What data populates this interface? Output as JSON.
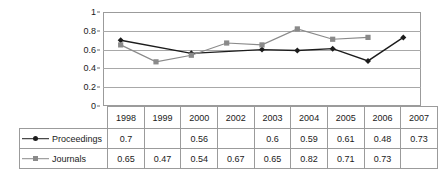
{
  "chart_data": {
    "type": "line",
    "title": "",
    "subtitle": "",
    "xlabel": "",
    "ylabel": "",
    "categories": [
      "1998",
      "1999",
      "2000",
      "2002",
      "2003",
      "2004",
      "2005",
      "2006",
      "2007"
    ],
    "series": [
      {
        "name": "Proceedings",
        "marker": "diamond",
        "color": "#1c1c1c",
        "values": [
          0.7,
          null,
          0.56,
          null,
          0.6,
          0.59,
          0.61,
          0.48,
          0.73
        ],
        "labels": [
          "0.7",
          "",
          "0.56",
          "",
          "0.6",
          "0.59",
          "0.61",
          "0.48",
          "0.73"
        ]
      },
      {
        "name": "Journals",
        "marker": "square",
        "color": "#8a8a8a",
        "values": [
          0.65,
          0.47,
          0.54,
          0.67,
          0.65,
          0.82,
          0.71,
          0.73,
          null
        ],
        "labels": [
          "0.65",
          "0.47",
          "0.54",
          "0.67",
          "0.65",
          "0.82",
          "0.71",
          "0.73",
          ""
        ]
      }
    ],
    "ylim": [
      0,
      1
    ],
    "yticks": [
      0,
      0.2,
      0.4,
      0.6,
      0.8,
      1
    ],
    "ytick_labels": [
      "0",
      "0.2",
      "0.4",
      "0.6",
      "0.8",
      "1"
    ],
    "grid": "horizontal",
    "legend_position": "bottom-data-table",
    "has_data_table": true
  },
  "colors": {
    "proceedings": "#1c1c1c",
    "journals": "#8a8a8a",
    "gridline": "#a8a8a8",
    "border": "#9b9b9b",
    "background": "#ffffff",
    "text": "#1a1a1a"
  }
}
